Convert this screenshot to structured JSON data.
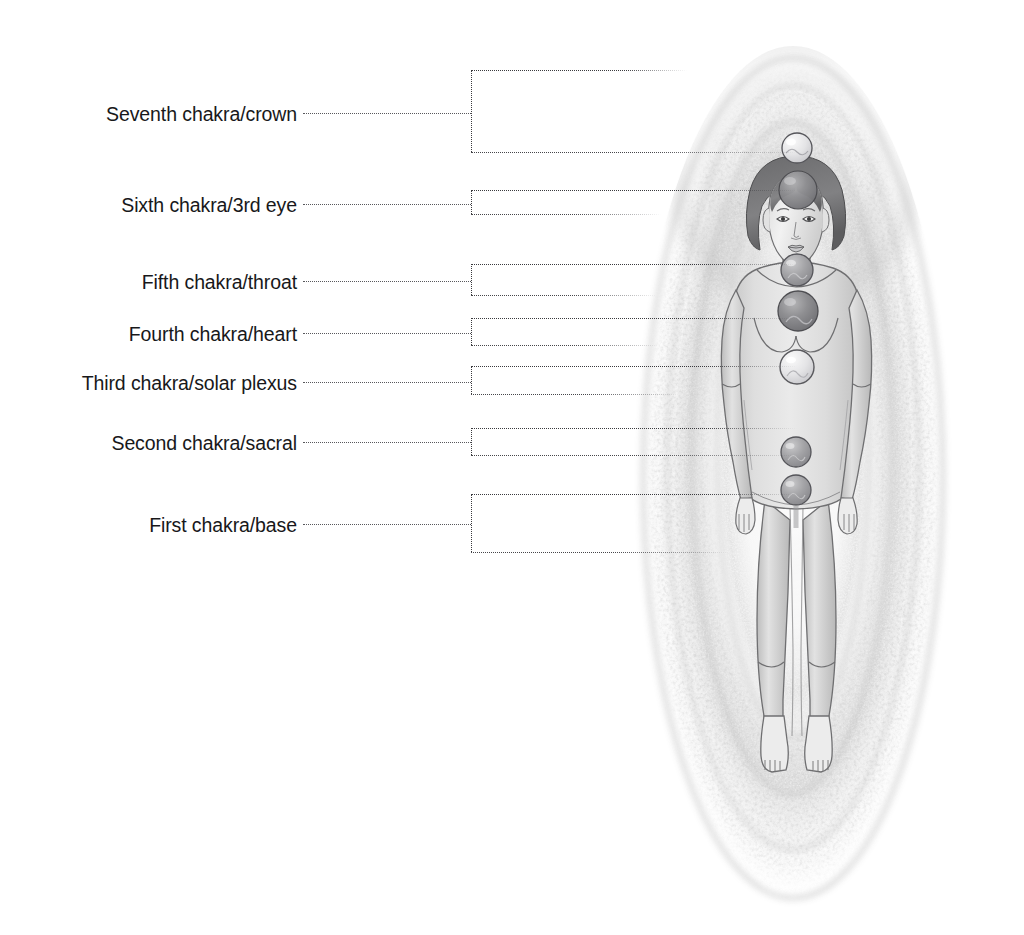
{
  "diagram": {
    "background_color": "#ffffff",
    "label_color": "#18181a",
    "leader_color": "#58585c",
    "aura_color": "#cfcfcf",
    "figure_color": "#d9d9d9",
    "chakra_orb_color": "#9a9a9c"
  },
  "labels": [
    {
      "id": "seventh",
      "text": "Seventh chakra/crown",
      "label_right_x": 297,
      "label_center_y": 115,
      "leader_y": 113,
      "stem_x": 471,
      "box_top_y": 70,
      "box_bottom_y": 152,
      "top_line_end_x": 687,
      "bottom_line_end_x": 797
    },
    {
      "id": "sixth",
      "text": "Sixth chakra/3rd eye",
      "label_right_x": 297,
      "label_center_y": 206,
      "leader_y": 204,
      "stem_x": 471,
      "box_top_y": 190,
      "box_bottom_y": 214,
      "top_line_end_x": 797,
      "bottom_line_end_x": 661
    },
    {
      "id": "fifth",
      "text": "Fifth chakra/throat",
      "label_right_x": 297,
      "label_center_y": 283,
      "leader_y": 281,
      "stem_x": 471,
      "box_top_y": 264,
      "box_bottom_y": 295,
      "top_line_end_x": 797,
      "bottom_line_end_x": 657
    },
    {
      "id": "fourth",
      "text": "Fourth chakra/heart",
      "label_right_x": 297,
      "label_center_y": 335,
      "leader_y": 333,
      "stem_x": 471,
      "box_top_y": 318,
      "box_bottom_y": 345,
      "top_line_end_x": 797,
      "bottom_line_end_x": 659
    },
    {
      "id": "third",
      "text": "Third chakra/solar plexus",
      "label_right_x": 297,
      "label_center_y": 384,
      "leader_y": 382,
      "stem_x": 471,
      "box_top_y": 366,
      "box_bottom_y": 394,
      "top_line_end_x": 797,
      "bottom_line_end_x": 680
    },
    {
      "id": "second",
      "text": "Second chakra/sacral",
      "label_right_x": 297,
      "label_center_y": 444,
      "leader_y": 442,
      "stem_x": 471,
      "box_top_y": 428,
      "box_bottom_y": 455,
      "top_line_end_x": 797,
      "bottom_line_end_x": 797
    },
    {
      "id": "first",
      "text": "First chakra/base",
      "label_right_x": 297,
      "label_center_y": 526,
      "leader_y": 524,
      "stem_x": 471,
      "box_top_y": 494,
      "box_bottom_y": 552,
      "top_line_end_x": 797,
      "bottom_line_end_x": 730
    }
  ],
  "chakras": [
    {
      "id": "crown",
      "label": "Seventh chakra/crown",
      "cx": 797,
      "cy": 148,
      "r": 15,
      "tone": "light"
    },
    {
      "id": "third-eye",
      "label": "Sixth chakra/3rd eye",
      "cx": 798,
      "cy": 190,
      "r": 19,
      "tone": "dark"
    },
    {
      "id": "throat",
      "label": "Fifth chakra/throat",
      "cx": 797,
      "cy": 270,
      "r": 16,
      "tone": "mid"
    },
    {
      "id": "heart",
      "label": "Fourth chakra/heart",
      "cx": 798,
      "cy": 311,
      "r": 20,
      "tone": "dark"
    },
    {
      "id": "solar-plexus",
      "label": "Third chakra/solar plexus",
      "cx": 797,
      "cy": 367,
      "r": 17,
      "tone": "light"
    },
    {
      "id": "sacral",
      "label": "Second chakra/sacral",
      "cx": 796,
      "cy": 452,
      "r": 15,
      "tone": "mid"
    },
    {
      "id": "base",
      "label": "First chakra/base",
      "cx": 796,
      "cy": 490,
      "r": 15,
      "tone": "mid"
    }
  ]
}
